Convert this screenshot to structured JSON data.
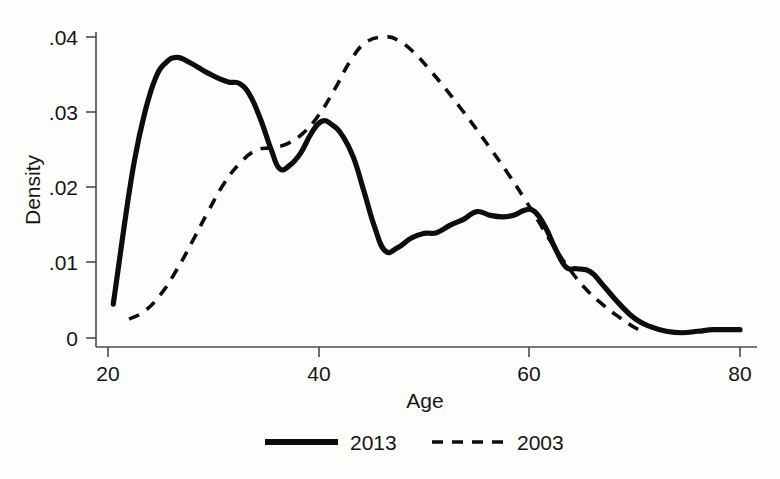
{
  "chart_data": {
    "type": "line",
    "title": "",
    "xlabel": "Age",
    "ylabel": "Density",
    "xlim": [
      20,
      81
    ],
    "ylim": [
      0,
      0.0425
    ],
    "xticks": [
      20,
      40,
      60,
      80
    ],
    "xtick_labels": [
      "20",
      "40",
      "60",
      "80"
    ],
    "yticks": [
      0,
      0.01,
      0.02,
      0.03,
      0.04
    ],
    "ytick_labels": [
      "0",
      ".01",
      ".02",
      ".03",
      ".04"
    ],
    "grid": false,
    "legend_position": "below",
    "series": [
      {
        "name": "2013",
        "style": "solid",
        "color": "#0d0d0d",
        "x": [
          20.5,
          21.5,
          22.5,
          23.5,
          24.5,
          25.5,
          26.5,
          27.5,
          28.5,
          29.5,
          30.5,
          31.5,
          32.5,
          33.5,
          34.5,
          35.5,
          36.3,
          37.3,
          38.3,
          39.3,
          40.3,
          41.3,
          42.3,
          43.3,
          44.3,
          45.3,
          46.3,
          47.5,
          48.8,
          50.0,
          51.2,
          52.5,
          53.8,
          55.0,
          56.3,
          57.5,
          58.5,
          59.6,
          60.5,
          61.5,
          62.5,
          63.5,
          64.5,
          65.8,
          67.0,
          68.5,
          70.0,
          71.5,
          73.0,
          74.5,
          76.0,
          77.5,
          79.0,
          80.0
        ],
        "y": [
          0.0045,
          0.0145,
          0.0235,
          0.03,
          0.0345,
          0.0366,
          0.0373,
          0.0368,
          0.036,
          0.0352,
          0.0345,
          0.034,
          0.0338,
          0.0322,
          0.029,
          0.025,
          0.0225,
          0.023,
          0.0246,
          0.0272,
          0.0288,
          0.0283,
          0.0268,
          0.024,
          0.0195,
          0.0148,
          0.0116,
          0.012,
          0.0133,
          0.0139,
          0.014,
          0.015,
          0.0158,
          0.0168,
          0.0163,
          0.0161,
          0.0163,
          0.017,
          0.0168,
          0.0148,
          0.0118,
          0.0094,
          0.0092,
          0.0088,
          0.007,
          0.0046,
          0.0026,
          0.0015,
          0.0009,
          0.0007,
          0.0009,
          0.0011,
          0.0011,
          0.0011
        ]
      },
      {
        "name": "2003",
        "style": "dashed",
        "color": "#0d0d0d",
        "x": [
          22.0,
          23.5,
          25.0,
          26.5,
          28.0,
          29.5,
          31.0,
          32.5,
          34.0,
          35.5,
          37.0,
          38.5,
          40.0,
          41.5,
          43.0,
          44.5,
          46.3,
          47.5,
          49.0,
          50.5,
          52.0,
          53.5,
          55.0,
          56.5,
          58.0,
          59.5,
          61.0,
          62.5,
          64.0,
          65.5,
          67.0,
          68.5,
          70.0,
          71.0
        ],
        "y": [
          0.0025,
          0.0036,
          0.0058,
          0.009,
          0.0128,
          0.0168,
          0.0205,
          0.0232,
          0.0249,
          0.0253,
          0.0258,
          0.0272,
          0.0296,
          0.033,
          0.0368,
          0.0393,
          0.04,
          0.0396,
          0.038,
          0.0357,
          0.0332,
          0.0305,
          0.0277,
          0.0248,
          0.0218,
          0.0186,
          0.0152,
          0.0118,
          0.0088,
          0.0063,
          0.0044,
          0.0028,
          0.0014,
          0.0008
        ]
      }
    ]
  },
  "axes": {
    "ylabel": "Density",
    "xlabel": "Age",
    "xtick_labels": [
      "20",
      "40",
      "60",
      "80"
    ],
    "ytick_labels": [
      "0",
      ".01",
      ".02",
      ".03",
      ".04"
    ]
  },
  "legend": {
    "items": [
      {
        "label": "2013",
        "style": "solid"
      },
      {
        "label": "2003",
        "style": "dashed"
      }
    ]
  }
}
